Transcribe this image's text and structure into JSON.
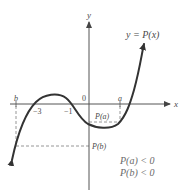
{
  "diagram": {
    "function_label": "y = P(x)",
    "axes": {
      "x_label": "x",
      "y_label": "y"
    },
    "origin_label": "0",
    "x_ticks": [
      {
        "label": "b",
        "italic": true
      },
      {
        "label": "−3",
        "italic": false
      },
      {
        "label": "−1",
        "italic": false
      },
      {
        "label": "a",
        "italic": true
      }
    ],
    "value_labels": {
      "pa": "P(a)",
      "pb": "P(b)"
    },
    "conditions": [
      "P(a) < 0",
      "P(b) < 0"
    ],
    "colors": {
      "curve": "#3a3a3a",
      "axis": "#555555",
      "dashed": "#8a8a8a",
      "text": "#4a4a4a"
    }
  }
}
